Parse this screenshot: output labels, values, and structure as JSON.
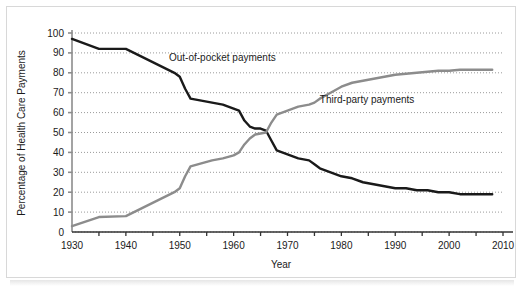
{
  "chart_data": {
    "type": "line",
    "title": "",
    "xlabel": "Year",
    "ylabel": "Percentage of Health Care Payments",
    "xlim": [
      1930,
      2010
    ],
    "ylim": [
      0,
      100
    ],
    "xticks": [
      1930,
      1940,
      1950,
      1960,
      1970,
      1980,
      1990,
      2000,
      2010
    ],
    "xtick_labels": [
      "1930",
      "1940",
      "1950",
      "1960",
      "1970",
      "1980",
      "1990",
      "2000",
      "2010"
    ],
    "xminor_ticks": [
      1935,
      1945,
      1955,
      1965,
      1975,
      1985,
      1995,
      2005
    ],
    "yticks": [
      0,
      10,
      20,
      30,
      40,
      50,
      60,
      70,
      80,
      90,
      100
    ],
    "ytick_labels": [
      "0",
      "10",
      "20",
      "30",
      "40",
      "50",
      "60",
      "70",
      "80",
      "90",
      "100"
    ],
    "grid": "horizontal-dotted",
    "legend": "inline-labels",
    "series": [
      {
        "name": "Out-of-pocket payments",
        "color": "#1a1a1a",
        "label_x": 1948,
        "label_y": 86,
        "x": [
          1930,
          1935,
          1940,
          1943,
          1946,
          1949,
          1950,
          1951,
          1952,
          1954,
          1956,
          1958,
          1960,
          1961,
          1962,
          1963,
          1964,
          1965,
          1966,
          1967,
          1968,
          1969,
          1970,
          1972,
          1974,
          1975,
          1976,
          1978,
          1980,
          1982,
          1984,
          1986,
          1988,
          1990,
          1992,
          1994,
          1996,
          1998,
          2000,
          2002,
          2004,
          2006,
          2008
        ],
        "y": [
          97,
          92,
          92,
          88,
          84,
          80,
          78,
          72,
          67,
          66,
          65,
          64,
          62,
          61,
          56,
          53,
          52,
          52,
          51,
          46,
          41,
          40,
          39,
          37,
          36,
          34,
          32,
          30,
          28,
          27,
          25,
          24,
          23,
          22,
          22,
          21,
          21,
          20,
          20,
          19,
          19,
          19,
          19
        ]
      },
      {
        "name": "Third-party payments",
        "color": "#8c8c8c",
        "label_x": 1976,
        "label_y": 65,
        "x": [
          1930,
          1935,
          1940,
          1943,
          1946,
          1949,
          1950,
          1951,
          1952,
          1954,
          1956,
          1958,
          1960,
          1961,
          1962,
          1963,
          1964,
          1965,
          1966,
          1967,
          1968,
          1969,
          1970,
          1972,
          1974,
          1975,
          1976,
          1978,
          1980,
          1982,
          1984,
          1986,
          1988,
          1990,
          1992,
          1994,
          1996,
          1998,
          2000,
          2002,
          2004,
          2006,
          2008
        ],
        "y": [
          3,
          7.5,
          8,
          12,
          16,
          20,
          22,
          28,
          33,
          34.5,
          36,
          37,
          38.5,
          40,
          44,
          47,
          49,
          49.5,
          50,
          55,
          59,
          60,
          61,
          63,
          64,
          65,
          67,
          70,
          73,
          75,
          76,
          77,
          78,
          79,
          79.5,
          80,
          80.5,
          81,
          81,
          81.5,
          81.5,
          81.5,
          81.5
        ]
      }
    ]
  },
  "axes": {
    "axis_color": "#8c8c8c",
    "grid_color": "#9a9a9a",
    "text_color": "#1a1a1a"
  }
}
